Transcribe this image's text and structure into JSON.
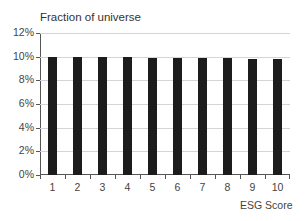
{
  "chart_data": {
    "type": "bar",
    "title": "Fraction of universe",
    "xlabel": "ESG Score",
    "ylabel": "",
    "categories": [
      "1",
      "2",
      "3",
      "4",
      "5",
      "6",
      "7",
      "8",
      "9",
      "10"
    ],
    "values": [
      10.0,
      10.0,
      9.95,
      9.95,
      9.9,
      9.9,
      9.85,
      9.85,
      9.8,
      9.8
    ],
    "value_unit": "%",
    "ylim": [
      0,
      12
    ],
    "yticks": [
      "0%",
      "2%",
      "4%",
      "6%",
      "8%",
      "10%",
      "12%"
    ],
    "grid": true,
    "legend": null,
    "bar_color": "#1c1c1c"
  }
}
